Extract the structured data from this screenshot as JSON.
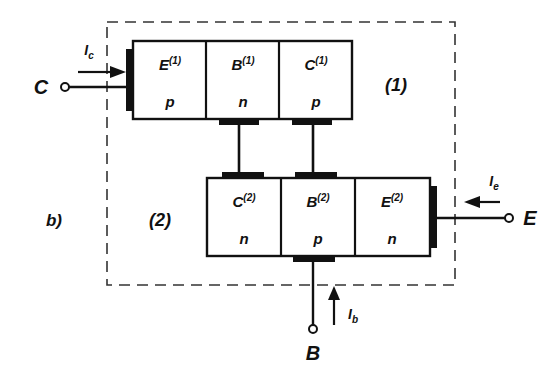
{
  "figure": {
    "panel_label": "b)",
    "region_labels": [
      {
        "name": "region-1",
        "text": "(1)"
      },
      {
        "name": "region-2",
        "text": "(2)"
      }
    ],
    "terminals": [
      {
        "name": "collector",
        "label": "C"
      },
      {
        "name": "emitter",
        "label": "E"
      },
      {
        "name": "base",
        "label": "B"
      }
    ],
    "currents": [
      {
        "name": "collector-current",
        "symbol": "I",
        "subscript": "c",
        "direction": "right"
      },
      {
        "name": "emitter-current",
        "symbol": "I",
        "subscript": "e",
        "direction": "left"
      },
      {
        "name": "base-current",
        "symbol": "I",
        "subscript": "b",
        "direction": "up"
      }
    ],
    "transistor_top": {
      "name": "transistor-1",
      "regions": [
        {
          "role": "emitter",
          "symbol": "E",
          "superscript": "(1)",
          "doping": "p"
        },
        {
          "role": "base",
          "symbol": "B",
          "superscript": "(1)",
          "doping": "n"
        },
        {
          "role": "collector",
          "symbol": "C",
          "superscript": "(1)",
          "doping": "p"
        }
      ]
    },
    "transistor_bottom": {
      "name": "transistor-2",
      "regions": [
        {
          "role": "collector",
          "symbol": "C",
          "superscript": "(2)",
          "doping": "n"
        },
        {
          "role": "base",
          "symbol": "B",
          "superscript": "(2)",
          "doping": "p"
        },
        {
          "role": "emitter",
          "symbol": "E",
          "superscript": "(2)",
          "doping": "n"
        }
      ]
    },
    "colors": {
      "ink": "#111111",
      "background": "#ffffff",
      "dash": "#333333"
    }
  }
}
